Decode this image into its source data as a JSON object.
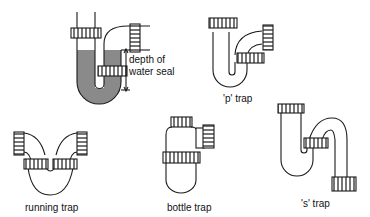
{
  "diagram": {
    "type": "plumbing trap types",
    "colors": {
      "line": "#1a1a1a",
      "water": "#8a8a8a",
      "background": "#ffffff"
    },
    "traps": [
      {
        "id": "seal",
        "annotation": {
          "line1": "depth of",
          "line2": "water seal"
        }
      },
      {
        "id": "p",
        "label": "'p' trap"
      },
      {
        "id": "running",
        "label": "running trap"
      },
      {
        "id": "bottle",
        "label": "bottle trap"
      },
      {
        "id": "s",
        "label": "'s' trap"
      }
    ]
  }
}
